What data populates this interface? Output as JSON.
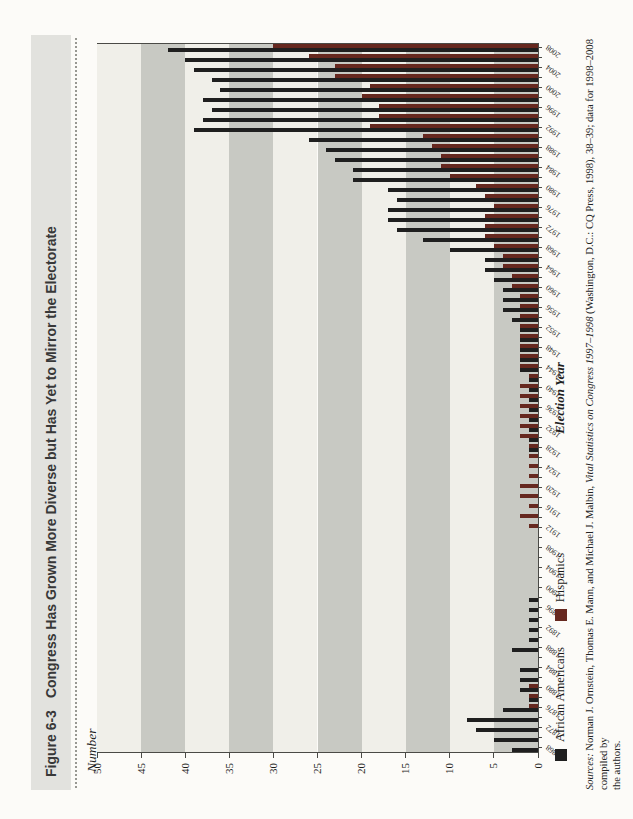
{
  "figure": {
    "label": "Figure 6-3",
    "title": "Congress Has Grown More Diverse but Has Yet to Mirror the Electorate"
  },
  "axes": {
    "y_title": "Number",
    "x_title": "Election Year",
    "y_ticks": [
      0,
      5,
      10,
      15,
      20,
      25,
      30,
      35,
      40,
      45,
      50
    ],
    "x_label_every_years": 4
  },
  "legend": [
    {
      "label": "African Americans",
      "color": "#1f1f1f"
    },
    {
      "label": "Hispanics",
      "color": "#66281f"
    }
  ],
  "source_note": {
    "prefix": "Sources:",
    "seg1": " Norman J. Ornstein, Thomas E. Mann, and Michael J. Malbin, ",
    "book_title": "Vital Statistics on Congress 1997–1998",
    "seg2": " (Washington, D.C.: CQ Press, 1998), 38–39; data for 1998–2008 compiled by",
    "line2": "the authors."
  },
  "page": {
    "rotation_note": "figure printed rotated 90° counterclockwise on portrait page"
  },
  "chart_data": {
    "type": "bar",
    "title": "Congress Has Grown More Diverse but Has Yet to Mirror the Electorate",
    "xlabel": "Election Year",
    "ylabel": "Number",
    "ylim": [
      0,
      50
    ],
    "grid": "alternating horizontal bands every 5 units",
    "band_light": "#f0efe9",
    "band_dark": "#c8c9c3",
    "legend_position": "below axis, left",
    "x": [
      1868,
      1870,
      1872,
      1874,
      1876,
      1878,
      1880,
      1882,
      1884,
      1886,
      1888,
      1890,
      1892,
      1894,
      1896,
      1898,
      1900,
      1902,
      1904,
      1906,
      1908,
      1910,
      1912,
      1914,
      1916,
      1918,
      1920,
      1922,
      1924,
      1926,
      1928,
      1930,
      1932,
      1934,
      1936,
      1938,
      1940,
      1942,
      1944,
      1946,
      1948,
      1950,
      1952,
      1954,
      1956,
      1958,
      1960,
      1962,
      1964,
      1966,
      1968,
      1970,
      1972,
      1974,
      1976,
      1978,
      1980,
      1982,
      1984,
      1986,
      1988,
      1990,
      1992,
      1994,
      1996,
      1998,
      2000,
      2002,
      2004,
      2006,
      2008
    ],
    "series": [
      {
        "name": "African Americans",
        "color": "#1f1f1f",
        "values": [
          3,
          5,
          7,
          8,
          4,
          1,
          2,
          2,
          2,
          0,
          3,
          1,
          1,
          1,
          1,
          1,
          0,
          0,
          0,
          0,
          0,
          0,
          0,
          0,
          0,
          0,
          0,
          0,
          0,
          0,
          1,
          1,
          1,
          1,
          1,
          1,
          1,
          1,
          2,
          2,
          2,
          2,
          2,
          3,
          4,
          4,
          4,
          5,
          6,
          6,
          10,
          13,
          16,
          17,
          17,
          16,
          17,
          21,
          21,
          23,
          24,
          26,
          39,
          38,
          37,
          38,
          36,
          37,
          39,
          40,
          42
        ]
      },
      {
        "name": "Hispanics",
        "color": "#66281f",
        "values": [
          0,
          0,
          0,
          0,
          1,
          1,
          1,
          0,
          0,
          0,
          0,
          0,
          0,
          0,
          0,
          0,
          0,
          0,
          0,
          0,
          0,
          0,
          1,
          2,
          1,
          2,
          2,
          1,
          1,
          1,
          1,
          2,
          2,
          2,
          2,
          2,
          2,
          1,
          2,
          2,
          2,
          2,
          2,
          2,
          2,
          2,
          3,
          3,
          4,
          4,
          5,
          6,
          6,
          6,
          5,
          6,
          7,
          10,
          11,
          11,
          12,
          13,
          19,
          18,
          18,
          20,
          19,
          23,
          23,
          26,
          30
        ]
      }
    ]
  }
}
